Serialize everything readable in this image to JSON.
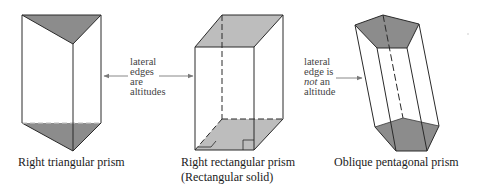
{
  "colors": {
    "background": "#ffffff",
    "edge": "#2a2a2a",
    "face_dark": "#8c8c8c",
    "face_light": "#bdbdbd",
    "arrow": "#7a7a7a",
    "text": "#1a1a1a",
    "note_text": "#444444"
  },
  "figures": [
    {
      "id": "triangular",
      "caption_lines": [
        "Right triangular prism"
      ],
      "top_face": [
        [
          22,
          15
        ],
        [
          101,
          15
        ],
        [
          73,
          44
        ]
      ],
      "bottom_face": [
        [
          22,
          123
        ],
        [
          101,
          123
        ],
        [
          73,
          151
        ]
      ]
    },
    {
      "id": "rectangular",
      "caption_lines": [
        "Right rectangular prism",
        "(Rectangular solid)"
      ],
      "top_face": [
        [
          195,
          47
        ],
        [
          254,
          47
        ],
        [
          283,
          15
        ],
        [
          222,
          15
        ]
      ],
      "bottom_face": [
        [
          195,
          150
        ],
        [
          254,
          150
        ],
        [
          283,
          119
        ],
        [
          222,
          119
        ]
      ]
    },
    {
      "id": "pentagonal",
      "caption_lines": [
        "Oblique pentagonal prism"
      ],
      "top_face": [
        [
          355,
          25
        ],
        [
          383,
          15
        ],
        [
          419,
          24
        ],
        [
          407,
          48
        ],
        [
          377,
          48
        ]
      ],
      "bottom_face": [
        [
          375,
          127
        ],
        [
          403,
          118
        ],
        [
          439,
          126
        ],
        [
          427,
          151
        ],
        [
          396,
          151
        ]
      ]
    }
  ],
  "annotations": [
    {
      "id": "lateral-edges-are-altitudes",
      "lines": [
        "lateral",
        "edges",
        "are",
        "altitudes"
      ]
    },
    {
      "id": "lateral-edge-is-not-an-altitude",
      "lines": [
        "lateral",
        "edge is",
        "not",
        " an",
        "altitude"
      ],
      "emphasis": "not"
    }
  ],
  "captions": {
    "triangular": "Right triangular prism",
    "rectangular_line1": "Right rectangular prism",
    "rectangular_line2": "(Rectangular solid)",
    "pentagonal": "Oblique pentagonal prism"
  },
  "notes": {
    "left": {
      "l1": "lateral",
      "l2": "edges",
      "l3": "are",
      "l4": "altitudes"
    },
    "right": {
      "l1": "lateral",
      "l2": "edge is",
      "l3_em": "not",
      "l3_rest": " an",
      "l4": "altitude"
    }
  }
}
